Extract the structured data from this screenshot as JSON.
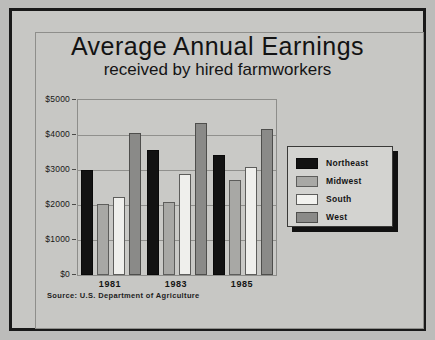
{
  "chart_data": {
    "type": "bar",
    "title": "Average Annual Earnings",
    "subtitle": "received by hired farmworkers",
    "xlabel": "",
    "ylabel": "",
    "categories": [
      "1981",
      "1983",
      "1985"
    ],
    "series": [
      {
        "name": "Northeast",
        "color": "#121212",
        "values": [
          3000,
          3580,
          3420
        ]
      },
      {
        "name": "Midwest",
        "color": "#a8a8a5",
        "values": [
          2030,
          2100,
          2720
        ]
      },
      {
        "name": "South",
        "color": "#efefec",
        "values": [
          2230,
          2900,
          3080
        ]
      },
      {
        "name": "West",
        "color": "#8a8a88",
        "values": [
          4050,
          4350,
          4180
        ]
      }
    ],
    "ylim": [
      0,
      5000
    ],
    "ytick_values": [
      0,
      1000,
      2000,
      3000,
      4000,
      5000
    ],
    "ytick_labels": [
      "$0",
      "$1000",
      "$2000",
      "$3000",
      "$4000",
      "$5000"
    ],
    "grid": true,
    "legend_position": "right",
    "annotations": [
      "Source: U.S. Department of Agriculture"
    ]
  },
  "header": {
    "title": "Average Annual Earnings",
    "subtitle": "received by hired farmworkers"
  },
  "axes": {
    "y_labels": [
      "$5000",
      "$4000",
      "$3000",
      "$2000",
      "$1000",
      "$0"
    ],
    "x_labels": [
      "1981",
      "1983",
      "1985"
    ]
  },
  "legend": {
    "items": [
      {
        "label": "Northeast",
        "swatch": "legend-swatch-northeast"
      },
      {
        "label": "Midwest",
        "swatch": "legend-swatch-midwest"
      },
      {
        "label": "South",
        "swatch": "legend-swatch-south"
      },
      {
        "label": "West",
        "swatch": "legend-swatch-west"
      }
    ]
  },
  "footer": {
    "source": "Source: U.S. Department of Agriculture"
  }
}
